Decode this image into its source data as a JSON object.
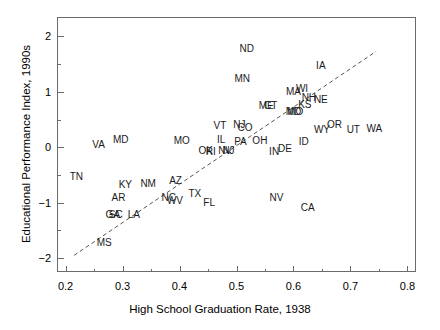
{
  "chart_data": {
    "type": "scatter",
    "title": "",
    "xlabel": "High School Graduation Rate, 1938",
    "ylabel": "Educational Performance Index, 1990s",
    "xlim": [
      0.185,
      0.815
    ],
    "ylim": [
      -2.25,
      2.35
    ],
    "xticks": [
      0.2,
      0.3,
      0.4,
      0.5,
      0.6,
      0.7,
      0.8
    ],
    "xticklabels": [
      "0.2",
      "0.3",
      "0.4",
      "0.5",
      "0.6",
      "0.7",
      "0.8"
    ],
    "xminorticks": [
      0.25,
      0.35,
      0.45,
      0.55,
      0.65,
      0.75
    ],
    "yticks": [
      -2,
      -1,
      0,
      1,
      2
    ],
    "yticklabels": [
      "−2",
      "−1",
      "0",
      "1",
      "2"
    ],
    "yminorticks": [
      -1.5,
      -0.5,
      0.5,
      1.5
    ],
    "grid": false,
    "legend": null,
    "point_marker": "text-label",
    "trendline": {
      "style": "dashed",
      "color": "#555555",
      "x0": 0.215,
      "y0": -1.95,
      "x1": 0.745,
      "y1": 1.73
    },
    "points": [
      {
        "label": "ND",
        "x": 0.518,
        "y": 1.78
      },
      {
        "label": "IA",
        "x": 0.648,
        "y": 1.46
      },
      {
        "label": "MN",
        "x": 0.51,
        "y": 1.24
      },
      {
        "label": "MA",
        "x": 0.6,
        "y": 1.0
      },
      {
        "label": "WI",
        "x": 0.615,
        "y": 1.05
      },
      {
        "label": "NH",
        "x": 0.627,
        "y": 0.88
      },
      {
        "label": "NE",
        "x": 0.648,
        "y": 0.86
      },
      {
        "label": "KS",
        "x": 0.62,
        "y": 0.76
      },
      {
        "label": "ME",
        "x": 0.552,
        "y": 0.74
      },
      {
        "label": "CT",
        "x": 0.56,
        "y": 0.74
      },
      {
        "label": "MD",
        "x": 0.6,
        "y": 0.63
      },
      {
        "label": "MO",
        "x": 0.603,
        "y": 0.63
      },
      {
        "label": "OR",
        "x": 0.672,
        "y": 0.4
      },
      {
        "label": "UT",
        "x": 0.705,
        "y": 0.31
      },
      {
        "label": "WA",
        "x": 0.742,
        "y": 0.33
      },
      {
        "label": "WY",
        "x": 0.65,
        "y": 0.31
      },
      {
        "label": "VT",
        "x": 0.471,
        "y": 0.38
      },
      {
        "label": "NJ",
        "x": 0.505,
        "y": 0.4
      },
      {
        "label": "CO",
        "x": 0.515,
        "y": 0.35
      },
      {
        "label": "MD",
        "x": 0.297,
        "y": 0.14
      },
      {
        "label": "VA",
        "x": 0.258,
        "y": 0.05
      },
      {
        "label": "MO",
        "x": 0.404,
        "y": 0.12
      },
      {
        "label": "IL",
        "x": 0.473,
        "y": 0.14
      },
      {
        "label": "PA",
        "x": 0.507,
        "y": 0.09
      },
      {
        "label": "OH",
        "x": 0.541,
        "y": 0.12
      },
      {
        "label": "ID",
        "x": 0.618,
        "y": 0.1
      },
      {
        "label": "OK",
        "x": 0.446,
        "y": -0.07
      },
      {
        "label": "RI",
        "x": 0.455,
        "y": -0.09
      },
      {
        "label": "NV",
        "x": 0.48,
        "y": -0.06
      },
      {
        "label": "NJ",
        "x": 0.486,
        "y": -0.07
      },
      {
        "label": "IN",
        "x": 0.566,
        "y": -0.08
      },
      {
        "label": "DE",
        "x": 0.585,
        "y": -0.04
      },
      {
        "label": "TN",
        "x": 0.219,
        "y": -0.54
      },
      {
        "label": "KY",
        "x": 0.305,
        "y": -0.68
      },
      {
        "label": "NM",
        "x": 0.345,
        "y": -0.67
      },
      {
        "label": "AZ",
        "x": 0.393,
        "y": -0.61
      },
      {
        "label": "TX",
        "x": 0.427,
        "y": -0.84
      },
      {
        "label": "AR",
        "x": 0.293,
        "y": -0.92
      },
      {
        "label": "NC",
        "x": 0.381,
        "y": -0.92
      },
      {
        "label": "WV",
        "x": 0.392,
        "y": -0.97
      },
      {
        "label": "FL",
        "x": 0.452,
        "y": -1.0
      },
      {
        "label": "NV",
        "x": 0.57,
        "y": -0.92
      },
      {
        "label": "CA",
        "x": 0.625,
        "y": -1.09
      },
      {
        "label": "GA",
        "x": 0.283,
        "y": -1.22
      },
      {
        "label": "SC",
        "x": 0.288,
        "y": -1.22
      },
      {
        "label": "LA",
        "x": 0.32,
        "y": -1.22
      },
      {
        "label": "MS",
        "x": 0.268,
        "y": -1.73
      }
    ]
  }
}
